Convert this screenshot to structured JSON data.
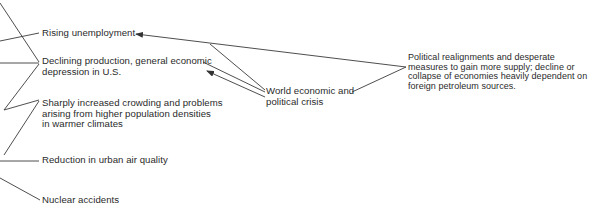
{
  "diagram": {
    "type": "cause-effect flow diagram",
    "left_effects": [
      {
        "id": "unemployment",
        "lines": [
          "Rising unemployment"
        ]
      },
      {
        "id": "production",
        "lines": [
          "Declining production, general economic",
          "depression in U.S."
        ]
      },
      {
        "id": "crowding",
        "lines": [
          "Sharply increased crowding and problems",
          "arising from higher population densities",
          "in warmer climates"
        ]
      },
      {
        "id": "air",
        "lines": [
          "Reduction in urban air quality"
        ]
      },
      {
        "id": "nuclear",
        "lines": [
          "Nuclear accidents"
        ]
      }
    ],
    "middle": {
      "id": "crisis",
      "lines": [
        "World economic and",
        "political crisis"
      ]
    },
    "right": {
      "id": "realignments",
      "lines": [
        "Political realignments and desperate",
        "measures to gain more supply; decline or",
        "collapse of economies heavily dependent on",
        "foreign petroleum sources."
      ]
    },
    "line_color": "#3a3a3a",
    "text_color": "#2a2a2a"
  }
}
